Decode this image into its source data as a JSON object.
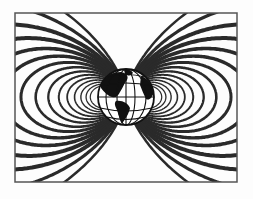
{
  "figure": {
    "frame": {
      "x": 15,
      "y": 13,
      "width": 222,
      "height": 169
    },
    "globe": {
      "cx": 126,
      "cy": 97,
      "r": 28
    },
    "colors": {
      "line": "#2a2a2a",
      "background": "#fdfdfd",
      "land": "#111111",
      "ocean": "#ffffff"
    }
  }
}
